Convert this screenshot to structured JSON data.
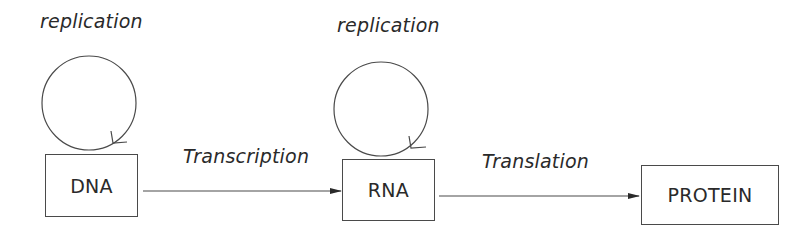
{
  "diagram": {
    "nodes": [
      {
        "id": "dna",
        "label": "DNA",
        "self_loop_label": "replication"
      },
      {
        "id": "rna",
        "label": "RNA",
        "self_loop_label": "replication"
      },
      {
        "id": "protein",
        "label": "PROTEIN"
      }
    ],
    "edges": [
      {
        "from": "dna",
        "to": "rna",
        "label": "Transcription"
      },
      {
        "from": "rna",
        "to": "protein",
        "label": "Translation"
      }
    ],
    "colors": {
      "stroke": "#4a4a4a",
      "text": "#2a2a2a",
      "background": "#ffffff"
    }
  }
}
